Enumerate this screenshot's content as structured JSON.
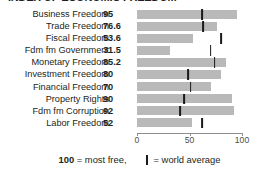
{
  "title": "INDEX OF ECONOMIC FREEDOM",
  "chart_data": {
    "type": "bar",
    "title": "INDEX OF ECONOMIC FREEDOM",
    "xlabel": "",
    "ylabel": "",
    "xlim": [
      0,
      100
    ],
    "grid": false,
    "orientation": "horizontal",
    "axis_ticks": [
      0,
      50,
      100
    ],
    "axis_tick_labels": [
      "0",
      "50",
      "100"
    ],
    "categories": [
      "Business Freedom",
      "Trade Freedom",
      "Fiscal Freedom",
      "Fdm fm Government",
      "Monetary Freedom",
      "Investment Freedom",
      "Financial Freedom",
      "Property Rights",
      "Fdm fm Corruption",
      "Labor Freedom"
    ],
    "values": [
      95,
      76.6,
      53.6,
      31.5,
      85.2,
      80,
      70,
      90,
      92,
      52
    ],
    "value_labels": [
      "95",
      "76.6",
      "53.6",
      "31.5",
      "85.2",
      "80",
      "70",
      "90",
      "92",
      "52"
    ],
    "series": [
      {
        "name": "Country score",
        "values": [
          95,
          76.6,
          53.6,
          31.5,
          85.2,
          80,
          70,
          90,
          92,
          52
        ]
      },
      {
        "name": "World average",
        "values": [
          62,
          63,
          80,
          70,
          74,
          49,
          51,
          45,
          41,
          62
        ]
      }
    ],
    "bar_color": "#b9b9b9",
    "marker_color": "#1a1a1a",
    "legend": [
      "100 = most free,",
      "= world average"
    ]
  },
  "rows": [
    {
      "label": "Business Freedom",
      "value": "95",
      "bar": 95,
      "avg": 62
    },
    {
      "label": "Trade Freedom",
      "value": "76.6",
      "bar": 76.6,
      "avg": 63
    },
    {
      "label": "Fiscal Freedom",
      "value": "53.6",
      "bar": 53.6,
      "avg": 80
    },
    {
      "label": "Fdm fm Government",
      "value": "31.5",
      "bar": 31.5,
      "avg": 70
    },
    {
      "label": "Monetary Freedom",
      "value": "85.2",
      "bar": 85.2,
      "avg": 74
    },
    {
      "label": "Investment Freedom",
      "value": "80",
      "bar": 80,
      "avg": 49
    },
    {
      "label": "Financial Freedom",
      "value": "70",
      "bar": 70,
      "avg": 51
    },
    {
      "label": "Property Rights",
      "value": "90",
      "bar": 90,
      "avg": 45
    },
    {
      "label": "Fdm fm Corruption",
      "value": "92",
      "bar": 92,
      "avg": 41
    },
    {
      "label": "Labor Freedom",
      "value": "52",
      "bar": 52,
      "avg": 62
    }
  ],
  "axis": {
    "ticks": [
      {
        "value": 0,
        "label": "0"
      },
      {
        "value": 50,
        "label": "50"
      },
      {
        "value": 100,
        "label": "100"
      }
    ]
  },
  "legend": {
    "most_free": "100",
    "most_free_text": "= most free,",
    "world_average_text": "= world average"
  },
  "colors": {
    "bar": "#b9b9b9",
    "marker": "#1a1a1a",
    "text": "#231f20",
    "axis": "#8c8c8c"
  }
}
